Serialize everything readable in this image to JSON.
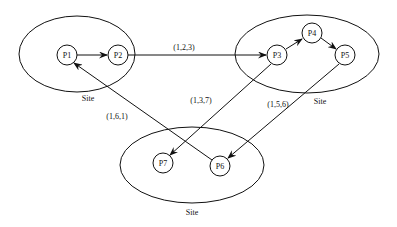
{
  "sites": [
    {
      "id": "site-1",
      "label": "Site",
      "cx": 77,
      "cy": 54,
      "rx": 58,
      "ry": 38,
      "label_x": 88,
      "label_y": 101
    },
    {
      "id": "site-2",
      "label": "Site",
      "cx": 307,
      "cy": 54,
      "rx": 72,
      "ry": 39,
      "label_x": 320,
      "label_y": 104
    },
    {
      "id": "site-3",
      "label": "Site",
      "cx": 192,
      "cy": 165,
      "rx": 72,
      "ry": 38,
      "label_x": 192,
      "label_y": 215
    }
  ],
  "processes": [
    {
      "id": "P1",
      "label": "P1",
      "x": 67,
      "y": 55
    },
    {
      "id": "P2",
      "label": "P2",
      "x": 118,
      "y": 55
    },
    {
      "id": "P3",
      "label": "P3",
      "x": 277,
      "y": 55
    },
    {
      "id": "P4",
      "label": "P4",
      "x": 312,
      "y": 33
    },
    {
      "id": "P5",
      "label": "P5",
      "x": 345,
      "y": 55
    },
    {
      "id": "P6",
      "label": "P6",
      "x": 220,
      "y": 166
    },
    {
      "id": "P7",
      "label": "P7",
      "x": 163,
      "y": 163
    }
  ],
  "edges": [
    {
      "from": "P1",
      "to": "P2",
      "label": ""
    },
    {
      "from": "P2",
      "to": "P3",
      "label": "(1,2,3)"
    },
    {
      "from": "P3",
      "to": "P4",
      "label": ""
    },
    {
      "from": "P4",
      "to": "P5",
      "label": ""
    },
    {
      "from": "P3",
      "to": "P7",
      "label": "(1,3,7)"
    },
    {
      "from": "P5",
      "to": "P6",
      "label": "(1,5,6)"
    },
    {
      "from": "P6",
      "to": "P1",
      "label": "(1,6,1)"
    }
  ],
  "edge_labels": {
    "e_2_3": "(1,2,3)",
    "e_3_7": "(1,3,7)",
    "e_5_6": "(1,5,6)",
    "e_6_1": "(1,6,1)"
  },
  "node_radius": 10
}
